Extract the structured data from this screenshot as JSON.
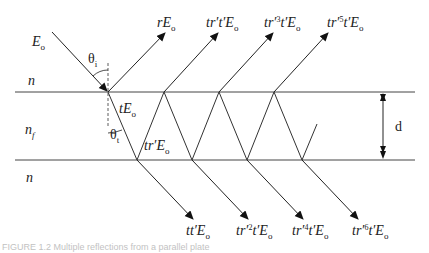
{
  "figure": {
    "media_labels": {
      "top": "n",
      "film": "n",
      "film_sub": "f",
      "bottom": "n"
    },
    "incident": {
      "label": "E",
      "sub": "o"
    },
    "angles": {
      "incident": "θ",
      "incident_sub": "i",
      "transmitted": "θ",
      "transmitted_sub": "t"
    },
    "internal": {
      "first_transmitted": {
        "prefix": "t",
        "main": "E",
        "sub": "o"
      },
      "first_reflected": {
        "prefix": "tr′",
        "main": "E",
        "sub": "o"
      }
    },
    "reflected_beams": [
      {
        "pre": "r",
        "sup": "",
        "mid": "",
        "main": "E",
        "sub": "o"
      },
      {
        "pre": "tr′t′",
        "sup": "",
        "mid": "",
        "main": "E",
        "sub": "o"
      },
      {
        "pre": "tr′",
        "sup": "3",
        "mid": "t′",
        "main": "E",
        "sub": "o"
      },
      {
        "pre": "tr′",
        "sup": "5",
        "mid": "t′",
        "main": "E",
        "sub": "o"
      }
    ],
    "transmitted_beams": [
      {
        "pre": "tt′",
        "sup": "",
        "mid": "",
        "main": "E",
        "sub": "o"
      },
      {
        "pre": "tr′",
        "sup": "2",
        "mid": "t′",
        "main": "E",
        "sub": "o"
      },
      {
        "pre": "tr′",
        "sup": "4",
        "mid": "t′",
        "main": "E",
        "sub": "o"
      },
      {
        "pre": "tr′",
        "sup": "6",
        "mid": "t′",
        "main": "E",
        "sub": "o"
      }
    ],
    "thickness_label": "d",
    "caption": "FIGURE 1.2  Multiple reflections from a parallel plate"
  }
}
